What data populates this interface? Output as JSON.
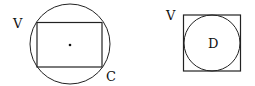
{
  "figures": [
    {
      "id": "left",
      "description": "rectangle inscribed in circle",
      "labels": {
        "rect": "V",
        "circle": "C"
      }
    },
    {
      "id": "right",
      "description": "circle inscribed in square",
      "labels": {
        "square": "V",
        "circle": "D"
      }
    }
  ]
}
